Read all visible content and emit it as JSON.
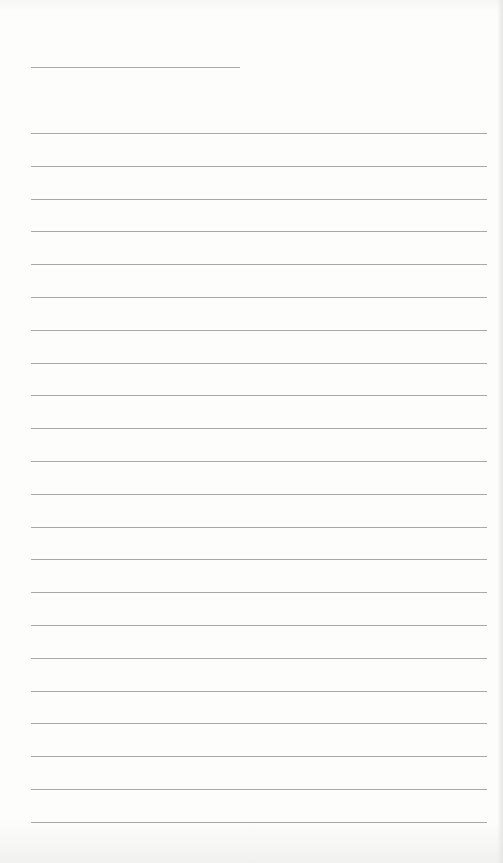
{
  "page": {
    "type": "blank-lined-sheet",
    "background_color": "#fdfdfc",
    "line_color": "#a8a8a8",
    "title_line": {
      "top": 67,
      "left": 31,
      "width": 209
    },
    "rules": {
      "count": 22,
      "first_top": 133,
      "spacing": 32.8,
      "left": 31,
      "width": 456
    }
  }
}
